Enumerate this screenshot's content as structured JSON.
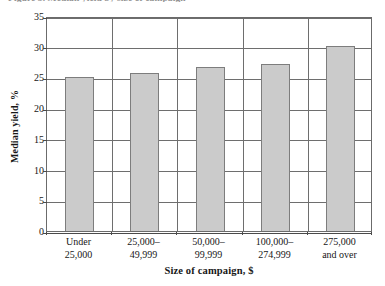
{
  "figure": {
    "caption_remnant": "Figure 3. Median yield by size of campaign"
  },
  "chart_data": {
    "type": "bar",
    "title": "",
    "categories": [
      "Under 25,000",
      "25,000–49,999",
      "50,000–99,999",
      "100,000–274,999",
      "275,000 and over"
    ],
    "category_lines": [
      [
        "Under",
        "25,000"
      ],
      [
        "25,000–",
        "49,999"
      ],
      [
        "50,000–",
        "99,999"
      ],
      [
        "100,000–",
        "274,999"
      ],
      [
        "275,000",
        "and over"
      ]
    ],
    "values": [
      25.0,
      25.8,
      26.7,
      27.2,
      30.2
    ],
    "xlabel": "Size of campaign, $",
    "ylabel": "Median yield, %",
    "ylim": [
      0,
      35
    ],
    "ytick_values": [
      0,
      5,
      10,
      15,
      20,
      25,
      30,
      35
    ],
    "ytick_labels": [
      "0",
      "5",
      "10",
      "15",
      "20",
      "25",
      "30",
      "35"
    ],
    "grid": "horizontal-and-vertical",
    "legend": "none",
    "colors": {
      "bar_fill": "#cbcbcb",
      "bar_border": "#7d7d7d",
      "gridline": "#6e6e6e",
      "axis": "#4a4a4a",
      "text": "#171717",
      "background": "#ffffff"
    }
  }
}
